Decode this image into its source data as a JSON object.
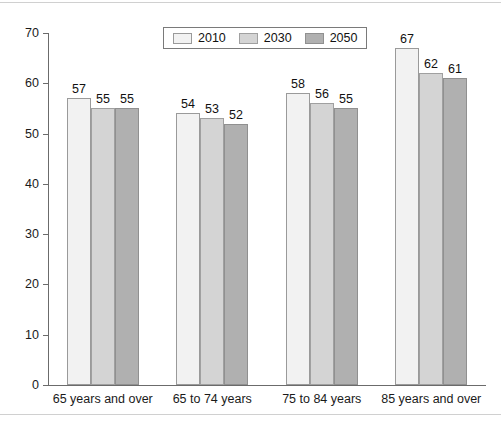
{
  "chart_data": {
    "type": "bar",
    "title": "",
    "subtitle": "",
    "xlabel": "",
    "ylabel": "",
    "ylim": [
      0,
      70
    ],
    "yticks": [
      0,
      10,
      20,
      30,
      40,
      50,
      60,
      70
    ],
    "ytick_labels": [
      "0",
      "10",
      "20",
      "30",
      "40",
      "50",
      "60",
      "70"
    ],
    "grid": false,
    "legend_position": "top-center",
    "categories": [
      "65 years and over",
      "65 to 74 years",
      "75 to 84 years",
      "85 years and over"
    ],
    "series": [
      {
        "name": "2010",
        "color": "#f2f2f2",
        "values": [
          57,
          54,
          58,
          67
        ]
      },
      {
        "name": "2030",
        "color": "#d4d4d4",
        "values": [
          55,
          53,
          56,
          62
        ]
      },
      {
        "name": "2050",
        "color": "#b0b0b0",
        "values": [
          55,
          52,
          55,
          61
        ]
      }
    ],
    "data_labels": [
      [
        "57",
        "55",
        "55"
      ],
      [
        "54",
        "53",
        "52"
      ],
      [
        "58",
        "56",
        "55"
      ],
      [
        "67",
        "62",
        "61"
      ]
    ]
  },
  "legend": {
    "items": [
      {
        "label": "2010",
        "swatch": "legend-swatch-2010"
      },
      {
        "label": "2030",
        "swatch": "legend-swatch-2030"
      },
      {
        "label": "2050",
        "swatch": "legend-swatch-2050"
      }
    ]
  },
  "axes": {
    "y": {
      "ticks": [
        "70",
        "60",
        "50",
        "40",
        "30",
        "20",
        "10",
        "0"
      ]
    },
    "x": {
      "labels": [
        "65 years and over",
        "65 to 74 years",
        "75 to 84 years",
        "85 years and over"
      ]
    }
  },
  "colors": {
    "series_2010": "#f2f2f2",
    "series_2030": "#d4d4d4",
    "series_2050": "#b0b0b0",
    "axis": "#6b6b6b",
    "text": "#111111",
    "rule": "#d0d0d0"
  }
}
